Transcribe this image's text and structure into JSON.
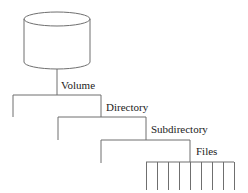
{
  "diagram": {
    "line_color": "#6f6f6f",
    "text_color": "#222222",
    "nodes": {
      "volume": {
        "label": "Volume",
        "icon": "disk-cylinder-icon"
      },
      "directory": {
        "label": "Directory"
      },
      "subdirectory": {
        "label": "Subdirectory"
      },
      "files": {
        "label": "Files",
        "count": 9
      }
    }
  }
}
